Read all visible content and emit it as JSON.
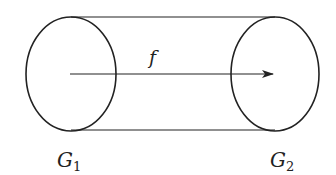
{
  "diagram": {
    "map_label": "f",
    "left_set": {
      "label": "G",
      "subscript": "1"
    },
    "right_set": {
      "label": "G",
      "subscript": "2"
    },
    "stroke_color": "#222222",
    "background": "#ffffff"
  }
}
